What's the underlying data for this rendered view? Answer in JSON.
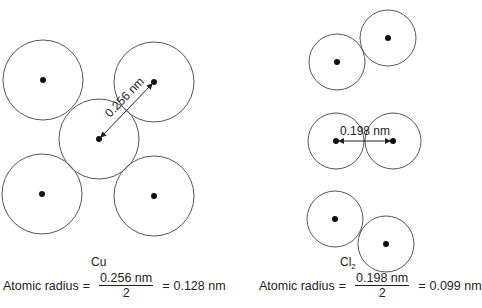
{
  "colors": {
    "circle_stroke": "#555555",
    "nucleus": "#111111",
    "text": "#222222",
    "background": "#ffffff"
  },
  "cu_panel": {
    "label": "Cu",
    "distance_label": "0.256 nm",
    "atoms": [
      {
        "cx": 43,
        "cy": 80,
        "r": 40
      },
      {
        "cx": 154,
        "cy": 82,
        "r": 40
      },
      {
        "cx": 99,
        "cy": 139,
        "r": 40
      },
      {
        "cx": 42,
        "cy": 194,
        "r": 40
      },
      {
        "cx": 154,
        "cy": 196,
        "r": 40
      }
    ],
    "formula": {
      "prefix": "Atomic radius",
      "equals1": "=",
      "numerator": "0.256 nm",
      "denominator": "2",
      "equals2": "=",
      "result": "0.128 nm"
    }
  },
  "cl2_panel": {
    "label_main": "Cl",
    "label_sub": "2",
    "distance_label": "0.198 nm",
    "pairs": [
      {
        "atoms": [
          {
            "cx": 337,
            "cy": 62,
            "r": 28
          },
          {
            "cx": 388,
            "cy": 38,
            "r": 28
          }
        ]
      },
      {
        "atoms": [
          {
            "cx": 336,
            "cy": 141,
            "r": 28
          },
          {
            "cx": 393,
            "cy": 141,
            "r": 28
          }
        ]
      },
      {
        "atoms": [
          {
            "cx": 335,
            "cy": 219,
            "r": 28
          },
          {
            "cx": 386,
            "cy": 244,
            "r": 28
          }
        ]
      }
    ],
    "formula": {
      "prefix": "Atomic radius",
      "equals1": "=",
      "numerator": "0.198 nm",
      "denominator": "2",
      "equals2": "=",
      "result": "0.099 nm"
    }
  }
}
